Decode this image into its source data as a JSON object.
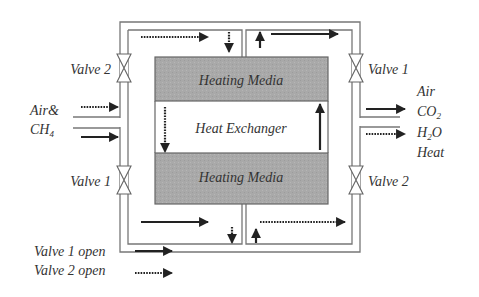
{
  "diagram": {
    "type": "process-flow",
    "components": {
      "heating_media_top": "Heating Media",
      "heating_media_bottom": "Heating Media",
      "heat_exchanger": "Heat Exchanger"
    },
    "valves": {
      "left_top": "Valve 2",
      "left_bottom": "Valve 1",
      "right_top": "Valve 1",
      "right_bottom": "Valve 2"
    },
    "inlet": {
      "line1": "Air&",
      "line2_main": "CH",
      "line2_sub": "4"
    },
    "outlet": {
      "line1": "Air",
      "line2_main": "CO",
      "line2_sub": "2",
      "line3_a": "H",
      "line3_sub": "2",
      "line3_b": "O",
      "line4": "Heat"
    },
    "legend": [
      {
        "label": "Valve 1 open",
        "style": "solid"
      },
      {
        "label": "Valve 2 open",
        "style": "dotted"
      }
    ],
    "colors": {
      "pipe": "#777777",
      "media_fill": "#a8a8a8",
      "arrow": "#222222",
      "text": "#333333"
    }
  }
}
